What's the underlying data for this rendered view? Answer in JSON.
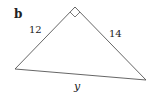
{
  "figure": {
    "part_label": "b",
    "triangle": {
      "type": "right-triangle",
      "right_angle_at": "apex",
      "vertices": {
        "apex": [
          75,
          7
        ],
        "left": [
          15,
          69
        ],
        "right": [
          146,
          80
        ]
      },
      "stroke_color": "#555555"
    },
    "sides": {
      "left_leg": "12",
      "right_leg": "14",
      "hypotenuse": "y"
    }
  }
}
